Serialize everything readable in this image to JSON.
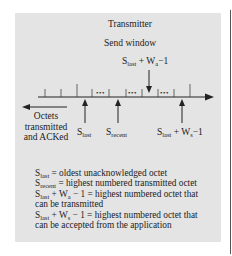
{
  "diagram": {
    "title": "Transmitter",
    "subtitle": "Send window",
    "top_pointer": {
      "base": "S",
      "sub": "last",
      "rest": " + W",
      "sub2": "a",
      "tail": "−1"
    },
    "left_arrow_label": [
      "Octets",
      "transmitted",
      "and ACKed"
    ],
    "pointers": [
      {
        "id": "s_last",
        "base": "S",
        "sub": "last",
        "rest": "",
        "sub2": "",
        "tail": ""
      },
      {
        "id": "s_recent",
        "base": "S",
        "sub": "recent",
        "rest": "",
        "sub2": "",
        "tail": ""
      },
      {
        "id": "s_last_ws",
        "base": "S",
        "sub": "last",
        "rest": " + W",
        "sub2": "s",
        "tail": "−1"
      }
    ],
    "ellipsis": "•••",
    "legend": [
      {
        "base": "S",
        "sub": "last",
        "mid": "",
        "sub2": "",
        "text": " = oldest unacknowledged octet"
      },
      {
        "base": "S",
        "sub": "recent",
        "mid": "",
        "sub2": "",
        "text": " = highest numbered transmitted octet"
      },
      {
        "base": "S",
        "sub": "last",
        "mid": " + W",
        "sub2": "a",
        "text": " − 1 = highest numbered octet that"
      },
      {
        "base": "",
        "sub": "",
        "mid": "",
        "sub2": "",
        "text": "can be transmitted"
      },
      {
        "base": "S",
        "sub": "last",
        "mid": " + W",
        "sub2": "s",
        "text": " − 1 = highest numbered octet that"
      },
      {
        "base": "",
        "sub": "",
        "mid": "",
        "sub2": "",
        "text": "can be accepted from the application"
      }
    ],
    "colors": {
      "panel": "#e4e4e4",
      "ink": "#222222"
    }
  }
}
